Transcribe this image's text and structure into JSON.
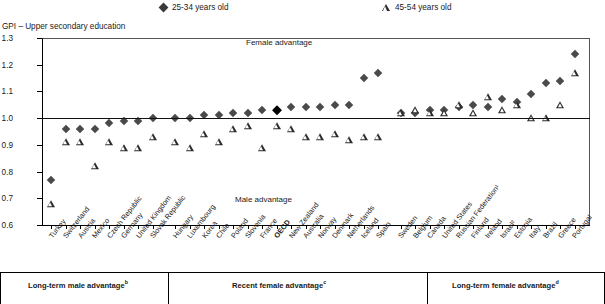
{
  "legend": {
    "items": [
      {
        "label": "25-34 years old",
        "marker": "filled-diamond-icon",
        "color": "#4a4a4a"
      },
      {
        "label": "45-54 years old",
        "marker": "open-triangle-icon",
        "color": "#2b2b2b"
      }
    ]
  },
  "axis": {
    "ylabel": "GPI – Upper secondary education",
    "yticks": [
      "1.3",
      "1.2",
      "1.1",
      "1.0",
      "0.9",
      "0.8",
      "0.7",
      "0.6"
    ],
    "ymin": 0.6,
    "ymax": 1.3,
    "reference_line": 1.0
  },
  "annotations": {
    "female_advantage": "Female advantage",
    "male_advantage": "Male advantage"
  },
  "footer": {
    "groups": [
      {
        "label": "Long-term male advantage",
        "sup": "b"
      },
      {
        "label": "Recent female advantage",
        "sup": "c"
      },
      {
        "label": "Long-term female advantage",
        "sup": "d"
      }
    ]
  },
  "chart_data": {
    "type": "scatter",
    "title": "GPI – Upper secondary education",
    "xlabel": "",
    "ylabel": "GPI – Upper secondary education",
    "ylim": [
      0.6,
      1.3
    ],
    "grid": false,
    "legend_position": "top",
    "reference_line": 1.0,
    "highlight_category": "OECD",
    "categories": [
      "Turkey",
      "Switzerland",
      "Austria",
      "Mexico",
      "Czech Republic",
      "Germany",
      "United Kingdom",
      "Slovak Republic",
      "Hungary",
      "Luxembourg",
      "Korea",
      "Chile",
      "Poland",
      "Slovenia",
      "France",
      "OECD",
      "New Zealand",
      "Australia",
      "Norway",
      "Denmark",
      "Netherlands",
      "Iceland",
      "Spain",
      "Sweden",
      "Belgium",
      "Canada",
      "United States",
      "Russian Federation¹",
      "Finland",
      "Ireland",
      "Israel²",
      "Estonia",
      "Italy",
      "Brazil",
      "Greece",
      "Portugal"
    ],
    "series": [
      {
        "name": "25-34 years old",
        "marker": "filled-diamond",
        "values": [
          0.77,
          0.96,
          0.96,
          0.96,
          0.98,
          0.99,
          0.99,
          1.0,
          1.0,
          1.0,
          1.01,
          1.01,
          1.02,
          1.02,
          1.03,
          1.03,
          1.04,
          1.04,
          1.04,
          1.05,
          1.05,
          1.15,
          1.17,
          1.02,
          1.02,
          1.03,
          1.03,
          1.04,
          1.05,
          1.04,
          1.07,
          1.06,
          1.09,
          1.13,
          1.14,
          1.24
        ]
      },
      {
        "name": "45-54 years old",
        "marker": "open-triangle",
        "values": [
          0.68,
          0.91,
          0.91,
          0.82,
          0.91,
          0.89,
          0.89,
          0.93,
          0.91,
          0.89,
          0.94,
          0.91,
          0.96,
          0.97,
          0.89,
          0.97,
          0.96,
          0.93,
          0.93,
          0.94,
          0.92,
          0.93,
          0.93,
          1.02,
          1.03,
          1.02,
          1.02,
          1.05,
          1.02,
          1.08,
          1.03,
          1.05,
          1.0,
          1.0,
          1.05,
          1.17
        ]
      }
    ],
    "group_bands": [
      {
        "label": "Long-term male advantage",
        "from": "Turkey",
        "to": "Slovak Republic"
      },
      {
        "label": "Recent female advantage",
        "from": "Hungary",
        "to": "Spain"
      },
      {
        "label": "Long-term female advantage",
        "from": "Sweden",
        "to": "Portugal"
      }
    ]
  }
}
